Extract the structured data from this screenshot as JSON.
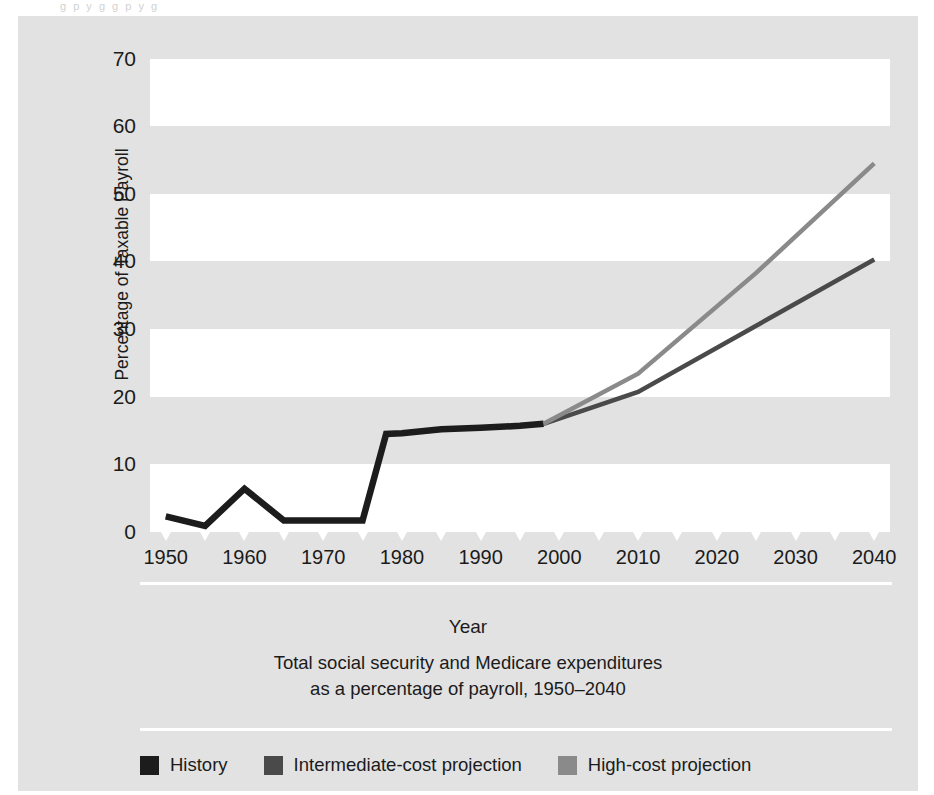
{
  "figure": {
    "axis_title": "Year",
    "caption_line1": "Total social security and Medicare expenditures",
    "caption_line2": "as a percentage of payroll, 1950–2040",
    "top_bleed_text": "g   p y g   g   p y      g"
  },
  "colors": {
    "panel_background": "#e2e2e2",
    "band_white": "#ffffff",
    "history": "#1c1c1c",
    "intermediate": "#4a4a4a",
    "high_cost": "#8a8a8a",
    "text": "#1b1b1b"
  },
  "legend": {
    "position": "bottom-left",
    "items": [
      {
        "label": "History",
        "color": "#1c1c1c",
        "swatch_name": "history-swatch"
      },
      {
        "label": "Intermediate-cost projection",
        "color": "#4a4a4a",
        "swatch_name": "intermediate-swatch"
      },
      {
        "label": "High-cost projection",
        "color": "#8a8a8a",
        "swatch_name": "high-cost-swatch"
      }
    ]
  },
  "chart_data": {
    "type": "line",
    "title": "Total social security and Medicare expenditures as a percentage of payroll, 1950–2040",
    "xlabel": "Year",
    "ylabel": "Percentage of Taxable Payroll",
    "xlim": [
      1948,
      2042
    ],
    "ylim": [
      0,
      72
    ],
    "xticks": [
      1950,
      1960,
      1970,
      1980,
      1990,
      2000,
      2010,
      2020,
      2030,
      2040
    ],
    "xtick_labels": [
      "1950",
      "1960",
      "1970",
      "1980",
      "1990",
      "2000",
      "2010",
      "2020",
      "2030",
      "2040"
    ],
    "minor_xticks": [
      1950,
      1955,
      1960,
      1965,
      1970,
      1975,
      1980,
      1985,
      1990,
      1995,
      2000,
      2005,
      2010,
      2015,
      2020,
      2025,
      2030,
      2035,
      2040
    ],
    "yticks": [
      0,
      10,
      20,
      30,
      40,
      50,
      60,
      70
    ],
    "ytick_labels": [
      "0",
      "10",
      "20",
      "30",
      "40",
      "50",
      "60",
      "70"
    ],
    "grid": false,
    "banded_background": true,
    "bands_white": [
      [
        0,
        10
      ],
      [
        20,
        30
      ],
      [
        40,
        50
      ],
      [
        60,
        70
      ]
    ],
    "series": [
      {
        "name": "History",
        "color": "#1c1c1c",
        "x": [
          1950,
          1955,
          1960,
          1965,
          1970,
          1975,
          1978,
          1980,
          1985,
          1990,
          1995,
          1998
        ],
        "y": [
          2.3,
          0.9,
          6.4,
          1.7,
          1.7,
          1.7,
          14.5,
          14.6,
          15.2,
          15.4,
          15.7,
          16.0
        ]
      },
      {
        "name": "Intermediate-cost projection",
        "color": "#4a4a4a",
        "x": [
          1998,
          2010,
          2040
        ],
        "y": [
          16.0,
          20.7,
          40.3
        ]
      },
      {
        "name": "High-cost projection",
        "color": "#8a8a8a",
        "x": [
          1998,
          2010,
          2025,
          2040
        ],
        "y": [
          16.0,
          23.4,
          38.3,
          54.5
        ]
      }
    ]
  }
}
